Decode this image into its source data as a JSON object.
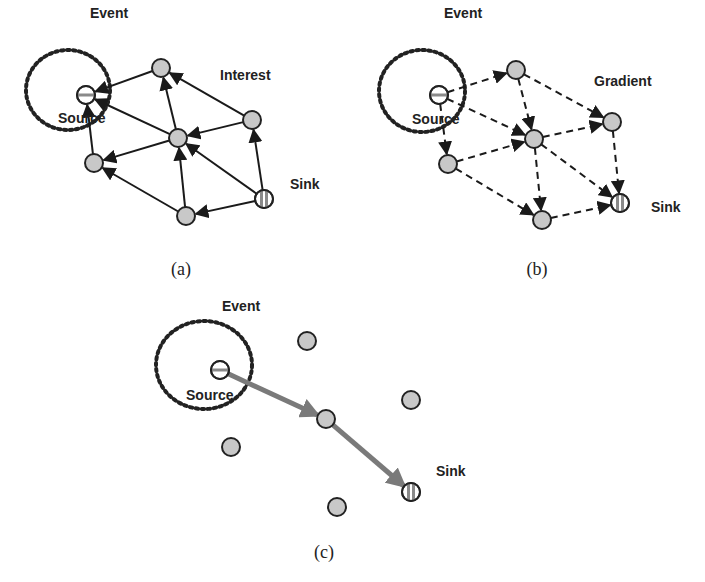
{
  "figure": {
    "panels": [
      {
        "id": "a",
        "caption": "(a)",
        "caption_pos": [
          181,
          275
        ],
        "event_label": "Event",
        "event_label_pos": [
          90,
          18
        ],
        "event_circle": {
          "cx": 68,
          "cy": 90,
          "rx": 42,
          "ry": 40
        },
        "phase_label": "Interest",
        "phase_label_pos": [
          220,
          80
        ],
        "source_label": "Source",
        "source_label_pos": [
          58,
          123
        ],
        "sink_label": "Sink",
        "sink_label_pos": [
          290,
          189
        ],
        "edge_style": "solid",
        "nodes": {
          "source": [
            86,
            95
          ],
          "top": [
            161,
            68
          ],
          "right": [
            252,
            120
          ],
          "center": [
            178,
            138
          ],
          "left": [
            94,
            163
          ],
          "bottom": [
            186,
            216
          ],
          "sink": [
            264,
            199
          ]
        },
        "edges": [
          [
            "top",
            "source"
          ],
          [
            "center",
            "source"
          ],
          [
            "left",
            "source"
          ],
          [
            "center",
            "top"
          ],
          [
            "right",
            "top"
          ],
          [
            "right",
            "center"
          ],
          [
            "center",
            "left"
          ],
          [
            "bottom",
            "left"
          ],
          [
            "bottom",
            "center"
          ],
          [
            "sink",
            "center"
          ],
          [
            "sink",
            "right"
          ],
          [
            "sink",
            "bottom"
          ]
        ]
      },
      {
        "id": "b",
        "caption": "(b)",
        "caption_pos": [
          537,
          275
        ],
        "event_label": "Event",
        "event_label_pos": [
          444,
          18
        ],
        "event_circle": {
          "cx": 422,
          "cy": 91,
          "rx": 43,
          "ry": 41
        },
        "phase_label": "Gradient",
        "phase_label_pos": [
          594,
          86
        ],
        "source_label": "Source",
        "source_label_pos": [
          412,
          124
        ],
        "sink_label": "Sink",
        "sink_label_pos": [
          651,
          212
        ],
        "edge_style": "dashed",
        "nodes": {
          "source": [
            439,
            95
          ],
          "top": [
            516,
            70
          ],
          "right": [
            612,
            122
          ],
          "center": [
            534,
            139
          ],
          "left": [
            448,
            164
          ],
          "bottom": [
            542,
            220
          ],
          "sink": [
            620,
            203
          ]
        },
        "edges": [
          [
            "source",
            "top"
          ],
          [
            "source",
            "center"
          ],
          [
            "source",
            "left"
          ],
          [
            "top",
            "center"
          ],
          [
            "top",
            "right"
          ],
          [
            "center",
            "right"
          ],
          [
            "left",
            "center"
          ],
          [
            "left",
            "bottom"
          ],
          [
            "center",
            "bottom"
          ],
          [
            "center",
            "sink"
          ],
          [
            "right",
            "sink"
          ],
          [
            "bottom",
            "sink"
          ]
        ]
      },
      {
        "id": "c",
        "caption": "(c)",
        "caption_pos": [
          324,
          558
        ],
        "event_label": "Event",
        "event_label_pos": [
          222,
          311
        ],
        "event_circle": {
          "cx": 204,
          "cy": 365,
          "rx": 48,
          "ry": 44
        },
        "phase_label": "",
        "phase_label_pos": [
          0,
          0
        ],
        "source_label": "Source",
        "source_label_pos": [
          186,
          400
        ],
        "sink_label": "Sink",
        "sink_label_pos": [
          436,
          476
        ],
        "edge_style": "thick-gray",
        "nodes": {
          "source": [
            220,
            370
          ],
          "top": [
            307,
            341
          ],
          "right": [
            411,
            400
          ],
          "center": [
            326,
            419
          ],
          "left": [
            231,
            447
          ],
          "bottom": [
            337,
            507
          ],
          "sink": [
            411,
            492
          ]
        },
        "edges": [
          [
            "source",
            "center"
          ],
          [
            "center",
            "sink"
          ]
        ]
      }
    ],
    "colors": {
      "node_fill": "#c8c8c8",
      "node_stroke": "#222222",
      "edge": "#1a1a1a",
      "path_edge": "#7a7a7a",
      "event_ring": "#222222",
      "background": "#ffffff"
    }
  }
}
